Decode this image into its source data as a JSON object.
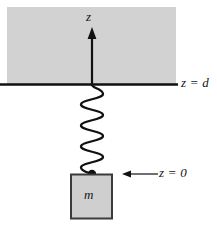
{
  "figure": {
    "kind": "physics-diagram",
    "colors": {
      "ceiling_fill": "#d2d2d2",
      "ceiling_stroke": "#d2d2d2",
      "mass_fill": "#cfcfcf",
      "mass_stroke": "#3b3b3b",
      "line": "#111111",
      "background": "#ffffff"
    },
    "labels": {
      "axis_z": "z",
      "level_d": "z = d",
      "level_0": "z = 0",
      "mass": "m"
    },
    "geometry": {
      "ceiling": {
        "x": 7,
        "y": 7,
        "width": 169,
        "height": 77
      },
      "ground_line": {
        "x1": 0,
        "y1": 84,
        "x2": 178,
        "y2": 84
      },
      "z_axis": {
        "x": 92,
        "y_bottom": 84,
        "y_top": 30
      },
      "spring": {
        "cx": 92,
        "y_top": 85,
        "y_bottom": 172,
        "coils": 9,
        "half_width": 11
      },
      "attachment_dot": {
        "cx": 92,
        "cy": 174,
        "r": 4
      },
      "mass_box": {
        "x": 70,
        "y": 174,
        "width": 42,
        "height": 45
      },
      "z0_arrow": {
        "x_tail": 158,
        "x_head": 124,
        "y": 174
      }
    }
  }
}
